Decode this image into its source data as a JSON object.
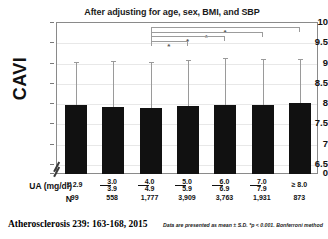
{
  "chart_data": {
    "type": "bar",
    "title": "After adjusting for age, sex, BMI, and SBP",
    "xlabel": "UA (mg/dl)",
    "ylabel": "CAVI",
    "ylim": [
      6.5,
      10
    ],
    "axis_break": true,
    "grid": true,
    "legend": null,
    "categories": [
      "≤ 2.9",
      "3.0–3.9",
      "4.0–4.9",
      "5.0–5.9",
      "6.0–6.9",
      "7.0–7.9",
      "≥ 8.0"
    ],
    "category_parts": [
      {
        "lo": "≤ 2.9",
        "hi": ""
      },
      {
        "lo": "3.0",
        "hi": "3.9"
      },
      {
        "lo": "4.0",
        "hi": "4.9"
      },
      {
        "lo": "5.0",
        "hi": "5.9"
      },
      {
        "lo": "6.0",
        "hi": "6.9"
      },
      {
        "lo": "7.0",
        "hi": "7.9"
      },
      {
        "lo": "≥ 8.0",
        "hi": ""
      }
    ],
    "values": [
      7.97,
      7.92,
      7.91,
      7.95,
      7.98,
      7.98,
      8.03
    ],
    "error_high": [
      9.05,
      9.07,
      9.05,
      9.08,
      9.14,
      9.12,
      9.11
    ],
    "n_counts": [
      "99",
      "558",
      "1,777",
      "3,909",
      "3,763",
      "1,931",
      "873"
    ],
    "n_label": "N",
    "yticks": [
      "10",
      "9.5",
      "9",
      "8.5",
      "8",
      "7.5",
      "7",
      "6.5",
      "0"
    ],
    "significance": [
      {
        "from": 2,
        "to": 6,
        "star": "*"
      },
      {
        "from": 2,
        "to": 5,
        "star": "*"
      },
      {
        "from": 2,
        "to": 4,
        "star": "*"
      },
      {
        "from": 2,
        "to": 3,
        "star": "*"
      }
    ],
    "annotations": {
      "footnote": "Data are presented as mean ± S.D.  *p < 0.001. Bonferroni method"
    }
  },
  "citation": "Atherosclerosis 239: 163-168, 2015",
  "colors": {
    "bar": "#111111",
    "error": "#9a9a9a",
    "grid": "#e8e8e8",
    "frame": "#8a8a8a",
    "text": "#111111"
  }
}
